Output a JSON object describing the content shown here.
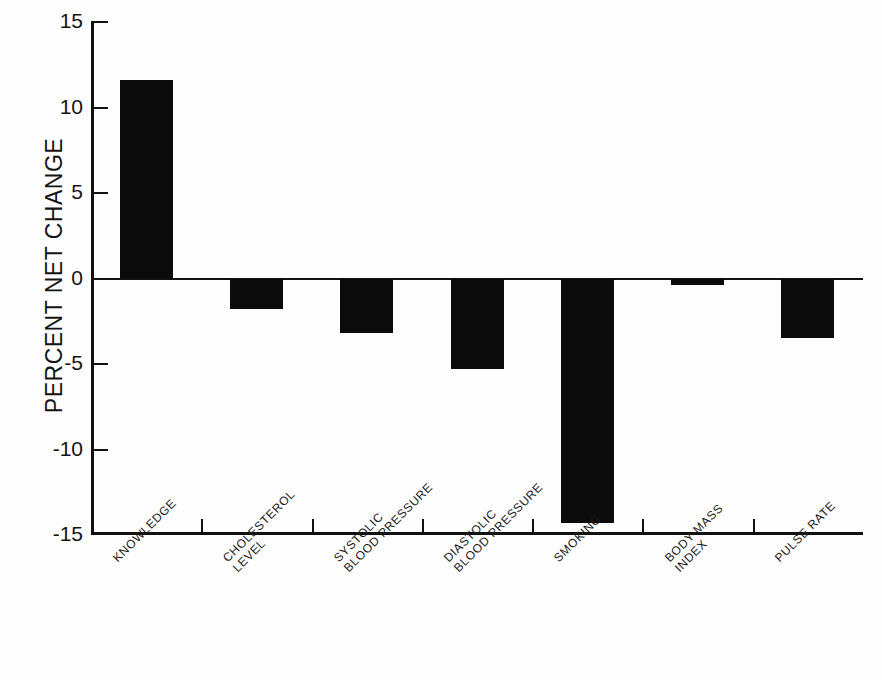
{
  "chart_data": {
    "type": "bar",
    "title": "",
    "xlabel": "",
    "ylabel": "PERCENT NET CHANGE",
    "ylim": [
      -15,
      15
    ],
    "yticks": [
      15,
      10,
      5,
      0,
      -5,
      -10,
      -15
    ],
    "ytick_labels": [
      "15",
      "10",
      "5",
      "0",
      "-5",
      "-10",
      "-15"
    ],
    "grid": false,
    "legend": false,
    "bar_color": "#0b0b0b",
    "categories": [
      "KNOWLEDGE",
      "CHOLESTEROL LEVEL",
      "SYSTOLIC BLOOD PRESSURE",
      "DIASTOLIC BLOOD PRESSURE",
      "SMOKING",
      "BODY-MASS INDEX",
      "PULSE RATE"
    ],
    "category_lines": [
      [
        "KNOWLEDGE"
      ],
      [
        "CHOLESTEROL",
        "LEVEL"
      ],
      [
        "SYSTOLIC",
        "BLOOD PRESSURE"
      ],
      [
        "DIASTOLIC",
        "BLOOD PRESSURE"
      ],
      [
        "SMOKING"
      ],
      [
        "BODY-MASS",
        "INDEX"
      ],
      [
        "PULSE RATE"
      ]
    ],
    "values": [
      11.6,
      -1.8,
      -3.2,
      -5.3,
      -14.3,
      -0.4,
      -3.5
    ]
  },
  "caption": {
    "sliver_text": ""
  }
}
